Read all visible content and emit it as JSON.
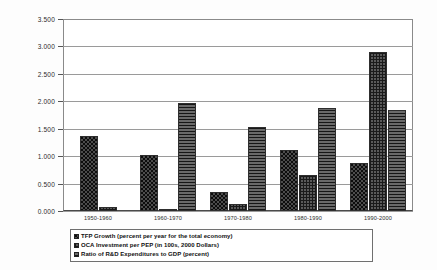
{
  "chart_data": {
    "type": "bar",
    "title": "",
    "xlabel": "",
    "ylabel": "",
    "ylim": [
      0.0,
      3.5
    ],
    "ytick_step": 0.5,
    "grid": true,
    "legend_position": "bottom",
    "categories": [
      "1950-1960",
      "1960-1970",
      "1970-1980",
      "1980-1990",
      "1990-2000"
    ],
    "ytick_labels": [
      "3.500",
      "3.000",
      "2.500",
      "2.000",
      "1.500",
      "1.000",
      "0.500",
      "0.000"
    ],
    "ytick_values": [
      3.5,
      3.0,
      2.5,
      2.0,
      1.5,
      1.0,
      0.5,
      0.0
    ],
    "series": [
      {
        "name": "TFP Growth (percent per year for the total economy)",
        "pattern": "dots",
        "color": "#4c4c4c",
        "values": [
          1.37,
          1.03,
          0.35,
          1.12,
          0.88
        ]
      },
      {
        "name": "OCA Investment per PEP (in 100s, 2000 Dollars)",
        "pattern": "grid",
        "color": "#5a5a5a",
        "values": [
          0.07,
          0.04,
          0.12,
          0.65,
          2.9
        ]
      },
      {
        "name": "Ratio of R&D Expenditures to GDP (percent)",
        "pattern": "hlines",
        "color": "#6a6a6a",
        "values": [
          null,
          1.96,
          1.54,
          1.87,
          1.85
        ]
      }
    ]
  },
  "legend": {
    "items": [
      "TFP Growth (percent per year for the total economy)",
      "OCA Investment per PEP (in 100s, 2000 Dollars)",
      "Ratio of R&D Expenditures to GDP (percent)"
    ]
  }
}
